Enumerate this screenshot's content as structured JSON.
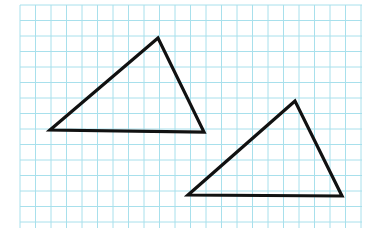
{
  "figure": {
    "width": 367,
    "height": 244,
    "background": "#ffffff"
  },
  "grid": {
    "x0": 20,
    "y0": 5,
    "x1": 362,
    "y1": 228,
    "cell": 15.5,
    "color": "#a8e0ec"
  },
  "shapes": [
    {
      "name": "triangle-1",
      "points": [
        [
          158,
          38
        ],
        [
          50,
          130
        ],
        [
          204,
          132
        ]
      ],
      "stroke": "#111111",
      "stroke_width": 3.2
    },
    {
      "name": "triangle-2",
      "points": [
        [
          295,
          101
        ],
        [
          188,
          195
        ],
        [
          342,
          196
        ]
      ],
      "stroke": "#111111",
      "stroke_width": 3.2
    }
  ]
}
